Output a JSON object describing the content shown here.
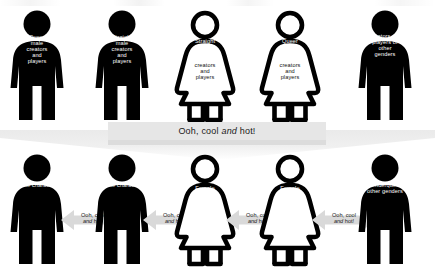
{
  "diagram": {
    "banner": {
      "text_before": "Ooh, cool ",
      "text_italic": "and",
      "text_after": " hot!",
      "full_text": "Ooh, cool and hot!",
      "background_color": "#e6e6e6"
    },
    "arrow_label": {
      "line1_before": "Ooh, cool",
      "line2_italic": "and",
      "line2_after": " hot!",
      "full_text": "Ooh, cool and hot!",
      "color": "#d9d9d9"
    },
    "top_row": {
      "figures": [
        {
          "id": "queer-male-creators",
          "icon": "male-figure-filled",
          "fill": "#000000",
          "label_white": "Queer\nmale\ncreators\nand\nplayers",
          "label_dark": ""
        },
        {
          "id": "straight-male-creators",
          "icon": "male-figure-filled",
          "fill": "#000000",
          "label_white": "Straight\nmale\ncreators\nand\nplayers",
          "label_dark": ""
        },
        {
          "id": "straight-female-creators",
          "icon": "female-figure-outline",
          "fill": "#ffffff",
          "label_white": "Straight\nfemale",
          "label_dark": "creators\nand\nplayers"
        },
        {
          "id": "queer-female-creators",
          "icon": "female-figure-outline",
          "fill": "#ffffff",
          "label_white": "Queer\nfemale",
          "label_dark": "creators\nand\nplayers"
        },
        {
          "id": "other-gender-creators",
          "icon": "male-figure-filled",
          "fill": "#000000",
          "label_white": "Creators and\nplayers of\nother\ngenders",
          "label_dark": ""
        }
      ]
    },
    "bottom_row": {
      "figures": [
        {
          "id": "male-character-1",
          "icon": "male-figure-filled",
          "fill": "#000000",
          "label_white": "Male character",
          "label_dark": ""
        },
        {
          "id": "male-character-2",
          "icon": "male-figure-filled",
          "fill": "#000000",
          "label_white": "Male character",
          "label_dark": ""
        },
        {
          "id": "female-character-1",
          "icon": "female-figure-outline",
          "fill": "#ffffff",
          "label_white": "Female\ncharacter",
          "label_dark": ""
        },
        {
          "id": "female-character-2",
          "icon": "female-figure-outline",
          "fill": "#ffffff",
          "label_white": "Female\ncharacter",
          "label_dark": ""
        },
        {
          "id": "genderqueer-character",
          "icon": "male-figure-filled",
          "fill": "#000000",
          "label_white": "Genderqueer,\nother genders",
          "label_dark": ""
        }
      ],
      "arrows": [
        {
          "id": "arrow-1",
          "label": "Ooh, cool and hot!"
        },
        {
          "id": "arrow-2",
          "label": "Ooh, cool and hot!"
        },
        {
          "id": "arrow-3",
          "label": "Ooh, cool and hot!"
        },
        {
          "id": "arrow-4",
          "label": "Ooh, cool and hot!"
        }
      ]
    }
  }
}
